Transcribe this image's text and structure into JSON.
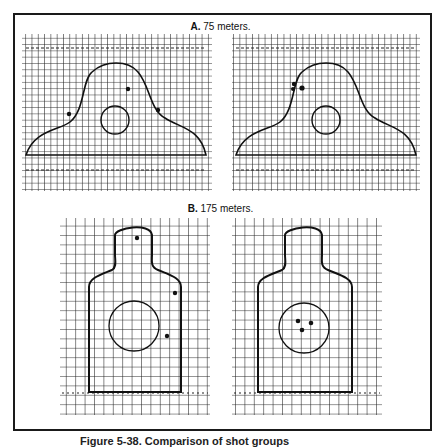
{
  "figure": {
    "section_a": {
      "letter": "A.",
      "title": "75 meters."
    },
    "section_b": {
      "letter": "B.",
      "title": "175 meters."
    },
    "caption": "Figure 5-38. Comparison of shot groups"
  },
  "targets": [
    {
      "id": "a-left",
      "section": "A",
      "range": "75 meters",
      "type": "silhouette-bust",
      "shots": 3,
      "grouping": "scattered"
    },
    {
      "id": "a-right",
      "section": "A",
      "range": "75 meters",
      "type": "silhouette-bust",
      "shots": 3,
      "grouping": "tight group upper-left shoulder"
    },
    {
      "id": "b-left",
      "section": "B",
      "range": "175 meters",
      "type": "silhouette-e-type",
      "shots": 3,
      "grouping": "scattered"
    },
    {
      "id": "b-right",
      "section": "B",
      "range": "175 meters",
      "type": "silhouette-e-type",
      "shots": 3,
      "grouping": "tight group in center circle"
    }
  ],
  "colors": {
    "ink": "#1a1a1a",
    "paper": "#ffffff",
    "grid": "#222222"
  }
}
